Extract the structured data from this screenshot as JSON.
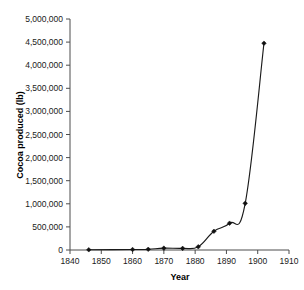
{
  "chart_data": {
    "type": "line",
    "title": "",
    "xlabel": "Year",
    "ylabel": "Cocoa produced (lb)",
    "xlim": [
      1840,
      1910
    ],
    "ylim": [
      0,
      5000000
    ],
    "grid": false,
    "legend": false,
    "marker": "filled-diamond",
    "line_color": "#1a1a1a",
    "axis_color": "#4d4d4d",
    "xticks": [
      1840,
      1850,
      1860,
      1870,
      1880,
      1890,
      1900,
      1910
    ],
    "xtick_labels": [
      "1840",
      "1850",
      "1860",
      "1870",
      "1880",
      "1890",
      "1900",
      "1910"
    ],
    "yticks": [
      0,
      500000,
      1000000,
      1500000,
      2000000,
      2500000,
      3000000,
      3500000,
      4000000,
      4500000,
      5000000
    ],
    "ytick_labels": [
      "0",
      "500,000",
      "1,000,000",
      "1,500,000",
      "2,000,000",
      "2,500,000",
      "3,000,000",
      "3,500,000",
      "4,000,000",
      "4,500,000",
      "5,000,000"
    ],
    "x": [
      1846,
      1860,
      1865,
      1870,
      1876,
      1881,
      1886,
      1891,
      1896,
      1902
    ],
    "values": [
      5000,
      10000,
      15000,
      40000,
      35000,
      70000,
      405000,
      580000,
      1010000,
      4475000
    ],
    "series": [
      {
        "name": "Cocoa produced (lb)",
        "x": [
          1846,
          1860,
          1865,
          1870,
          1876,
          1881,
          1886,
          1891,
          1896,
          1902
        ],
        "values": [
          5000,
          10000,
          15000,
          40000,
          35000,
          70000,
          405000,
          580000,
          1010000,
          4475000
        ]
      }
    ]
  }
}
